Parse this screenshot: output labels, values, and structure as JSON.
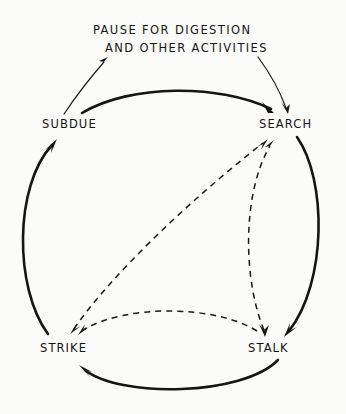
{
  "figure": {
    "background_color": "#fbfbfa",
    "line_color": "#151515"
  },
  "annotation": {
    "line1": "PAUSE FOR DIGESTION",
    "line2": "AND OTHER ACTIVITIES"
  },
  "nodes": [
    {
      "id": "subdue",
      "label": "SUBDUE",
      "x": 42,
      "y": 118,
      "position": "upper-left"
    },
    {
      "id": "search",
      "label": "SEARCH",
      "x": 259,
      "y": 118,
      "position": "upper-right"
    },
    {
      "id": "strike",
      "label": "STRIKE",
      "x": 40,
      "y": 342,
      "position": "lower-left"
    },
    {
      "id": "stalk",
      "label": "STALK",
      "x": 248,
      "y": 342,
      "position": "lower-right"
    }
  ],
  "edges": [
    {
      "id": "subdue-to-search",
      "from": "SUBDUE",
      "to": "SEARCH",
      "style": "solid",
      "arrow": "to"
    },
    {
      "id": "search-to-stalk",
      "from": "SEARCH",
      "to": "STALK",
      "style": "solid",
      "arrow": "to"
    },
    {
      "id": "stalk-to-strike",
      "from": "STALK",
      "to": "STRIKE",
      "style": "solid",
      "arrow": "to"
    },
    {
      "id": "strike-to-subdue",
      "from": "STRIKE",
      "to": "SUBDUE",
      "style": "solid",
      "arrow": "to"
    },
    {
      "id": "strike-to-search",
      "from": "STRIKE",
      "to": "SEARCH",
      "style": "dashed",
      "arrow": "both"
    },
    {
      "id": "stalk-to-search",
      "from": "STALK",
      "to": "SEARCH",
      "style": "dashed",
      "arrow": "both"
    },
    {
      "id": "stalk-to-strike-dashed",
      "from": "STALK",
      "to": "STRIKE",
      "style": "dashed",
      "arrow": "to"
    }
  ],
  "annotation_leaders": [
    {
      "id": "leader-subdue",
      "from": "SUBDUE",
      "to": "annotation",
      "arrow": "to-annotation"
    },
    {
      "id": "leader-search",
      "from": "annotation",
      "to": "SEARCH",
      "arrow": "to-node"
    }
  ]
}
